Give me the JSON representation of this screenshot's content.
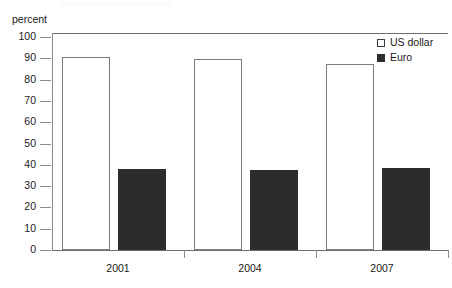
{
  "chart_data": {
    "type": "bar",
    "title": "",
    "subtitle": "",
    "xlabel": "",
    "ylabel": "percent",
    "categories": [
      "2001",
      "2004",
      "2007"
    ],
    "series": [
      {
        "name": "US dollar",
        "values": [
          90.5,
          89.5,
          87.5
        ],
        "color": "#ffffff",
        "edge_color": "#7d7d7d"
      },
      {
        "name": "Euro",
        "values": [
          38.0,
          37.8,
          38.3
        ],
        "color": "#2c2c2c",
        "edge_color": "#2c2c2c"
      }
    ],
    "ylim": [
      0,
      100
    ],
    "ytick_labels": [
      "100",
      "90",
      "80",
      "70",
      "60",
      "50",
      "40",
      "30",
      "20",
      "10",
      "0"
    ],
    "ytick_values": [
      100,
      90,
      80,
      70,
      60,
      50,
      40,
      30,
      20,
      10,
      0
    ],
    "grid": false,
    "legend_position": "top-right",
    "annotations": []
  },
  "axes": {
    "y_title": "percent"
  },
  "legend": {
    "entries": [
      {
        "label": "US dollar",
        "swatch": "open-square-swatch"
      },
      {
        "label": "Euro",
        "swatch": "filled-square-swatch"
      }
    ]
  }
}
